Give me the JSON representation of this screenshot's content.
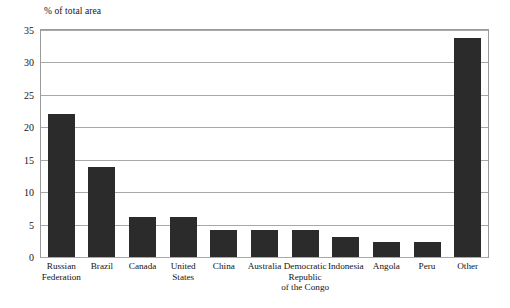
{
  "chart_data": {
    "type": "bar",
    "title": "",
    "subtitle": "",
    "xlabel": "",
    "ylabel": "% of total area",
    "ylim": [
      0,
      35
    ],
    "yticks": [
      0,
      5,
      10,
      15,
      20,
      25,
      30,
      35
    ],
    "grid": true,
    "legend": null,
    "orientation": "vertical",
    "bar_color": "#2b2b2b",
    "categories": [
      "Russian Federation",
      "Brazil",
      "Canada",
      "United States",
      "China",
      "Australia",
      "Democratic Republic of the Congo",
      "Indonesia",
      "Angola",
      "Peru",
      "Other"
    ],
    "category_lines": [
      [
        "Russian",
        "Federation"
      ],
      [
        "Brazil"
      ],
      [
        "Canada"
      ],
      [
        "United",
        "States"
      ],
      [
        "China"
      ],
      [
        "Australia"
      ],
      [
        "Democratic",
        "Republic",
        "of the Congo"
      ],
      [
        "Indonesia"
      ],
      [
        "Angola"
      ],
      [
        "Peru"
      ],
      [
        "Other"
      ]
    ],
    "values": [
      22.0,
      13.9,
      6.1,
      6.2,
      4.1,
      4.1,
      4.1,
      3.1,
      2.3,
      2.3,
      33.8
    ]
  }
}
